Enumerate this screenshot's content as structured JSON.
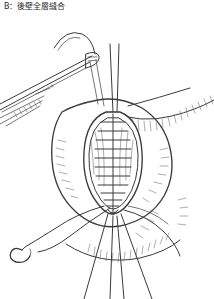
{
  "figure": {
    "caption": "B：後壁全層縫合",
    "panel_label": "B",
    "title_text": "後壁全層縫合",
    "type": "surgical-line-art-illustration",
    "background_color": "#ffffff",
    "ink_color": "#3a3a3a",
    "hatch_color": "#6a6a6a"
  },
  "elements": {
    "instrument_label": "needle-holder forceps",
    "suture_line_label": "running full-thickness suture",
    "needle_label": "curved surgical needle",
    "tissue_label": "bowel wall tissue edge",
    "lumen_label": "anastomosis lumen opening",
    "thread_label": "suture thread",
    "stitch_count": 12,
    "trailing_thread_count": 4
  }
}
